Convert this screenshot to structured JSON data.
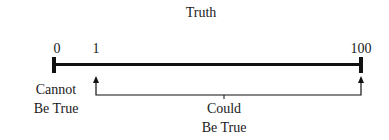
{
  "title": "Truth",
  "scale": {
    "min_label": "0",
    "first_label": "1",
    "max_label": "100"
  },
  "labels": {
    "cannot_line1": "Cannot",
    "cannot_line2": "Be True",
    "could_line1": "Could",
    "could_line2": "Be True"
  },
  "colors": {
    "line": "#111111",
    "text": "#1a1a1a",
    "background": "#ffffff"
  }
}
